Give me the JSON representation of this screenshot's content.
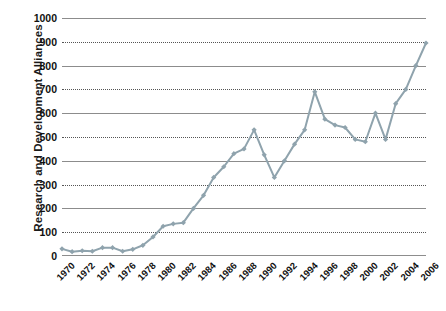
{
  "chart_data": {
    "type": "line",
    "title": "",
    "xlabel": "",
    "ylabel": "Research and Development Alliances",
    "ylim": [
      0,
      1000
    ],
    "xlim": [
      1970,
      2006
    ],
    "ytick_step": 100,
    "xtick_step": 2,
    "grid": true,
    "legend": false,
    "marker": "diamond",
    "line_color": "#8fa3ad",
    "marker_color": "#8fa3ad",
    "gridline_color": "#555555",
    "axis_color": "#8d8d8d",
    "yticks": [
      0,
      100,
      200,
      300,
      400,
      500,
      600,
      700,
      800,
      900,
      1000
    ],
    "ytick_labels": [
      "0",
      "100",
      "200",
      "300",
      "400",
      "500",
      "600",
      "700",
      "800",
      "900",
      "1000"
    ],
    "xticks": [
      1970,
      1972,
      1974,
      1976,
      1978,
      1980,
      1982,
      1984,
      1986,
      1988,
      1990,
      1992,
      1994,
      1996,
      1998,
      2000,
      2002,
      2004,
      2006
    ],
    "xtick_labels": [
      "1970",
      "1972",
      "1974",
      "1976",
      "1978",
      "1980",
      "1982",
      "1984",
      "1986",
      "1988",
      "1990",
      "1992",
      "1994",
      "1996",
      "1998",
      "2000",
      "2002",
      "2004",
      "2006"
    ],
    "series": [
      {
        "name": "Research and Development Alliances",
        "x": [
          1970,
          1971,
          1972,
          1973,
          1974,
          1975,
          1976,
          1977,
          1978,
          1979,
          1980,
          1981,
          1982,
          1983,
          1984,
          1985,
          1986,
          1987,
          1988,
          1989,
          1990,
          1991,
          1992,
          1993,
          1994,
          1995,
          1996,
          1997,
          1998,
          1999,
          2000,
          2001,
          2002,
          2003,
          2004,
          2005,
          2006
        ],
        "values": [
          30,
          18,
          22,
          20,
          35,
          35,
          20,
          28,
          45,
          80,
          125,
          135,
          140,
          200,
          255,
          330,
          375,
          430,
          450,
          530,
          425,
          330,
          400,
          470,
          530,
          690,
          575,
          550,
          540,
          490,
          480,
          600,
          490,
          640,
          700,
          800,
          895
        ]
      }
    ]
  }
}
